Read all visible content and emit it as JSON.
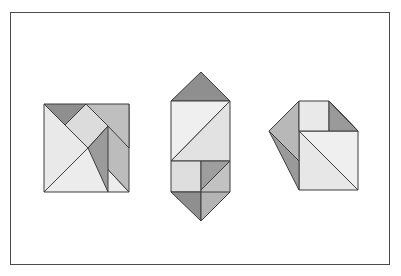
{
  "canvas": {
    "width": 401,
    "height": 276,
    "background": "#ffffff"
  },
  "frame": {
    "label": "outer-frame",
    "x": 10,
    "y": 12,
    "width": 380,
    "height": 253,
    "stroke": "#4a4a4a",
    "stroke_width": 1,
    "fill": "#ffffff"
  },
  "palette": {
    "outline": "#3d3d3d",
    "very_light": "#f1f1f1",
    "light": "#e4e4e4",
    "light_mid": "#d6d6d6",
    "mid": "#bcbcbc",
    "mid_dark": "#a6a6a6",
    "dark": "#8f8f8f",
    "darkest": "#7e7e7e"
  },
  "figures": [
    {
      "name": "tangram-square-left",
      "description": "Seven-piece tangram arranged as a square",
      "pieces": [
        {
          "name": "piece-large-triangle-lower-left",
          "points": "44,104 44,192 88,148",
          "fill": "#e9e9e9"
        },
        {
          "name": "piece-large-triangle-bottom",
          "points": "44,192 129,192 88,148",
          "fill": "#ececec"
        },
        {
          "name": "piece-small-triangle-top-left",
          "points": "44,104 86,104 65,125",
          "fill": "#8f8f8f"
        },
        {
          "name": "piece-medium-triangle-right",
          "points": "129,104 129,192 88,148",
          "fill": "#bcbcbc"
        },
        {
          "name": "piece-square-center",
          "points": "65,125 86,104 108,126 88,148",
          "fill": "#dcdcdc"
        },
        {
          "name": "piece-small-triangle-center",
          "points": "88,148 108,126 108,192",
          "fill": "#9b9b9b"
        },
        {
          "name": "piece-parallelogram-top-right",
          "points": "86,104 129,104 129,148 108,126",
          "fill": "#bfbfbf"
        }
      ]
    },
    {
      "name": "tangram-house-middle",
      "description": "Seven-piece tangram arranged as a vertical rocket/house form",
      "pieces": [
        {
          "name": "piece-roof-triangle-top",
          "points": "171,101 230,101 201,72",
          "fill": "#8f8f8f"
        },
        {
          "name": "piece-large-triangle-upper-left",
          "points": "171,101 171,161 230,101",
          "fill": "#efefef"
        },
        {
          "name": "piece-large-triangle-upper-right",
          "points": "230,101 230,161 171,161",
          "fill": "#e2e2e2"
        },
        {
          "name": "piece-square-lower-left",
          "points": "171,161 201,161 201,192 171,192",
          "fill": "#dedede"
        },
        {
          "name": "piece-small-triangle-lower-mid",
          "points": "201,161 230,161 201,190",
          "fill": "#9e9e9e"
        },
        {
          "name": "piece-parallelogram-lower-right",
          "points": "230,161 230,192 201,221 201,190",
          "fill": "#c2c2c2"
        },
        {
          "name": "piece-bottom-triangle",
          "points": "171,192 201,192 201,221",
          "fill": "#8f8f8f"
        },
        {
          "name": "piece-bottom-triangle-right",
          "points": "201,192 201,221 230,192",
          "fill": "#b4b4b4"
        }
      ]
    },
    {
      "name": "tangram-house-right",
      "description": "Seven-piece tangram arranged as a house with left wing",
      "pieces": [
        {
          "name": "piece-large-triangle-body",
          "points": "299,131 358,131 358,190",
          "fill": "#efefef"
        },
        {
          "name": "piece-large-triangle-lower",
          "points": "299,131 299,190 358,190",
          "fill": "#e7e7e7"
        },
        {
          "name": "piece-left-wing-upper",
          "points": "269,131 299,101 299,161",
          "fill": "#b8b8b8"
        },
        {
          "name": "piece-left-wing-lower",
          "points": "269,131 299,161 299,190",
          "fill": "#9a9a9a"
        },
        {
          "name": "piece-roof-square",
          "points": "299,101 329,101 329,131 299,131",
          "fill": "#e9e9e9"
        },
        {
          "name": "piece-roof-triangle-right",
          "points": "329,101 358,131 329,131",
          "fill": "#9a9a9a"
        },
        {
          "name": "piece-roof-edge-right",
          "points": "329,101 358,131 358,131",
          "fill": "#b0b0b0"
        }
      ]
    }
  ]
}
